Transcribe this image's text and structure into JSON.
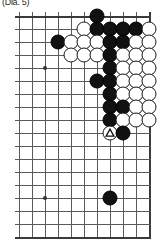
{
  "caption": {
    "text": "(Dia. 5)"
  },
  "board": {
    "type": "go-board-diagram",
    "description": "Partial go board showing upper right corner",
    "cols": 11,
    "rows": 18,
    "cell_px": 13,
    "origin": {
      "x": 4,
      "y": 4
    },
    "edges": {
      "top": true,
      "right": true,
      "bottom": true,
      "left": false
    },
    "grid_color": "#5a5a5a",
    "edge_color": "#3a3a3a",
    "star_points": [
      {
        "col": 2,
        "row": 4
      },
      {
        "col": 2,
        "row": 14
      }
    ],
    "stones": [
      {
        "col": 6,
        "row": 0,
        "color": "black"
      },
      {
        "col": 5,
        "row": 1,
        "color": "white"
      },
      {
        "col": 6,
        "row": 1,
        "color": "black"
      },
      {
        "col": 7,
        "row": 1,
        "color": "black"
      },
      {
        "col": 8,
        "row": 1,
        "color": "black"
      },
      {
        "col": 9,
        "row": 1,
        "color": "black"
      },
      {
        "col": 10,
        "row": 1,
        "color": "white"
      },
      {
        "col": 3,
        "row": 2,
        "color": "black"
      },
      {
        "col": 4,
        "row": 2,
        "color": "white"
      },
      {
        "col": 5,
        "row": 2,
        "color": "white"
      },
      {
        "col": 6,
        "row": 2,
        "color": "white"
      },
      {
        "col": 7,
        "row": 2,
        "color": "black"
      },
      {
        "col": 8,
        "row": 2,
        "color": "black"
      },
      {
        "col": 9,
        "row": 2,
        "color": "white"
      },
      {
        "col": 10,
        "row": 2,
        "color": "white"
      },
      {
        "col": 4,
        "row": 3,
        "color": "white"
      },
      {
        "col": 5,
        "row": 3,
        "color": "white"
      },
      {
        "col": 6,
        "row": 3,
        "color": "white"
      },
      {
        "col": 7,
        "row": 3,
        "color": "black"
      },
      {
        "col": 8,
        "row": 3,
        "color": "white"
      },
      {
        "col": 9,
        "row": 3,
        "color": "white"
      },
      {
        "col": 10,
        "row": 3,
        "color": "white"
      },
      {
        "col": 7,
        "row": 4,
        "color": "black"
      },
      {
        "col": 8,
        "row": 4,
        "color": "white"
      },
      {
        "col": 9,
        "row": 4,
        "color": "white"
      },
      {
        "col": 10,
        "row": 4,
        "color": "white"
      },
      {
        "col": 6,
        "row": 5,
        "color": "black"
      },
      {
        "col": 7,
        "row": 5,
        "color": "black"
      },
      {
        "col": 8,
        "row": 5,
        "color": "white"
      },
      {
        "col": 9,
        "row": 5,
        "color": "white"
      },
      {
        "col": 10,
        "row": 5,
        "color": "white"
      },
      {
        "col": 7,
        "row": 6,
        "color": "black"
      },
      {
        "col": 8,
        "row": 6,
        "color": "white"
      },
      {
        "col": 9,
        "row": 6,
        "color": "white"
      },
      {
        "col": 10,
        "row": 6,
        "color": "white"
      },
      {
        "col": 7,
        "row": 7,
        "color": "black"
      },
      {
        "col": 8,
        "row": 7,
        "color": "black"
      },
      {
        "col": 9,
        "row": 7,
        "color": "white"
      },
      {
        "col": 10,
        "row": 7,
        "color": "white"
      },
      {
        "col": 7,
        "row": 8,
        "color": "black"
      },
      {
        "col": 8,
        "row": 8,
        "color": "white"
      },
      {
        "col": 9,
        "row": 8,
        "color": "white"
      },
      {
        "col": 10,
        "row": 8,
        "color": "white"
      },
      {
        "col": 7,
        "row": 9,
        "color": "white",
        "mark": "triangle"
      },
      {
        "col": 8,
        "row": 9,
        "color": "black"
      },
      {
        "col": 7,
        "row": 14,
        "color": "black"
      }
    ],
    "marks": {
      "triangle": {
        "label": "triangle-mark",
        "color": "#111111"
      }
    }
  }
}
